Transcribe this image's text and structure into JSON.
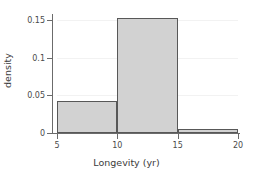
{
  "chart_data": {
    "type": "bar",
    "title": "",
    "subtitle": "",
    "xlabel": "Longevity (yr)",
    "ylabel": "density",
    "categories": [
      "5-10",
      "10-15",
      "15-20"
    ],
    "values": [
      0.042,
      0.153,
      0.005
    ],
    "bin_edges": [
      5,
      10,
      15,
      20
    ],
    "bin_width": 5,
    "x": [
      5,
      10,
      15
    ],
    "xlim": [
      5,
      20
    ],
    "ylim": [
      0,
      0.153
    ],
    "xticks": [
      5,
      10,
      15,
      20
    ],
    "yticks": [
      0,
      0.05,
      0.1,
      0.15
    ],
    "xticklabels": [
      "5",
      "10",
      "15",
      "20"
    ],
    "yticklabels": [
      "0",
      "0.05",
      "0.1",
      "0.15"
    ],
    "grid": "horizontal-faint",
    "legend": "none",
    "bar_fill_color": "#d2d2d2",
    "bar_edge_color": "#585858",
    "axis_color": "#6b6b6b",
    "gridline_color": "#f2f2f2",
    "background_color": "#ffffff",
    "annotations": []
  }
}
